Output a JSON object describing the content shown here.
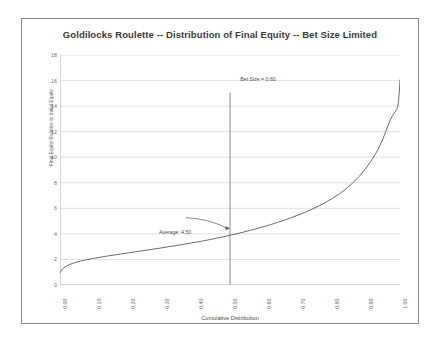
{
  "chart_data": {
    "type": "line",
    "title": "Goldilocks Roulette -- Distribution of Final Equity -- Bet Size Limited",
    "xlabel": "Cumulative Distribution",
    "ylabel": "Final Equity Relative to Initial Equity",
    "xlim": [
      0.0,
      1.0
    ],
    "ylim": [
      0,
      18
    ],
    "grid": true,
    "legend": "none",
    "xticks": [
      "0.00",
      "0.10",
      "0.20",
      "0.30",
      "0.40",
      "0.50",
      "0.60",
      "0.70",
      "0.80",
      "0.90",
      "1.00"
    ],
    "xtick_values": [
      0.0,
      0.1,
      0.2,
      0.3,
      0.4,
      0.5,
      0.6,
      0.7,
      0.8,
      0.9,
      1.0
    ],
    "yticks": [
      "0",
      "2",
      "4",
      "6",
      "8",
      "10",
      "12",
      "14",
      "16",
      "18"
    ],
    "ytick_values": [
      0,
      2,
      4,
      6,
      8,
      10,
      12,
      14,
      16,
      18
    ],
    "series": [
      {
        "name": "Final Equity Quantile Curve",
        "x": [
          0.0,
          0.005,
          0.01,
          0.015,
          0.02,
          0.03,
          0.04,
          0.05,
          0.06,
          0.08,
          0.1,
          0.12,
          0.14,
          0.16,
          0.18,
          0.2,
          0.22,
          0.24,
          0.26,
          0.28,
          0.3,
          0.32,
          0.34,
          0.36,
          0.38,
          0.4,
          0.42,
          0.44,
          0.46,
          0.48,
          0.5,
          0.52,
          0.54,
          0.56,
          0.58,
          0.6,
          0.62,
          0.64,
          0.66,
          0.68,
          0.7,
          0.72,
          0.74,
          0.76,
          0.78,
          0.8,
          0.82,
          0.84,
          0.86,
          0.88,
          0.9,
          0.915,
          0.93,
          0.94,
          0.95,
          0.958,
          0.965,
          0.972,
          0.978,
          0.983,
          0.987,
          0.99,
          0.992,
          0.994,
          0.995,
          0.996,
          0.997,
          0.998,
          0.9985,
          0.999,
          0.9995,
          1.0
        ],
        "y": [
          0.95,
          1.18,
          1.32,
          1.42,
          1.5,
          1.62,
          1.72,
          1.8,
          1.87,
          1.99,
          2.09,
          2.18,
          2.27,
          2.35,
          2.43,
          2.51,
          2.59,
          2.67,
          2.75,
          2.83,
          2.91,
          3.0,
          3.08,
          3.17,
          3.26,
          3.35,
          3.45,
          3.55,
          3.66,
          3.77,
          3.89,
          4.01,
          4.14,
          4.28,
          4.42,
          4.57,
          4.73,
          4.9,
          5.08,
          5.27,
          5.47,
          5.68,
          5.92,
          6.17,
          6.45,
          6.76,
          7.1,
          7.5,
          7.96,
          8.5,
          9.15,
          9.7,
          10.35,
          10.85,
          11.45,
          12.0,
          12.5,
          12.95,
          13.25,
          13.45,
          13.6,
          13.72,
          13.85,
          14.05,
          14.25,
          14.5,
          14.8,
          15.1,
          15.35,
          15.6,
          15.85,
          16.05
        ],
        "color": "#595959"
      }
    ],
    "annotations": [
      {
        "name": "bet-size-label",
        "text": "Bet Size = 0.60",
        "x": 0.5,
        "y": 17.2
      },
      {
        "name": "average-label",
        "text": "Average: 4.50",
        "x": 0.265,
        "y": 5.35,
        "arrow_to_x": 0.5,
        "arrow_to_y": 4.45
      }
    ],
    "vertical_line": {
      "name": "average-marker-line",
      "x": 0.5,
      "y_from": 0,
      "y_to": 15.05,
      "color": "#7a7a7a"
    }
  }
}
